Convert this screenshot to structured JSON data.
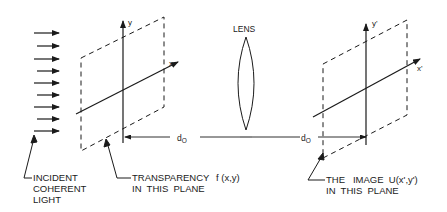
{
  "diagram": {
    "type": "optical-imaging-setup",
    "incident_light": {
      "arrow_count": 9,
      "label_lines": [
        "INCIDENT",
        "COHERENT",
        "LIGHT"
      ]
    },
    "object_plane": {
      "axis_x": "x",
      "axis_y": "y",
      "label_lines": [
        "TRANSPARENCY",
        "IN  THIS  PLANE"
      ],
      "function": "f (x,y)"
    },
    "lens": {
      "label": "LENS"
    },
    "distances": {
      "object_to_lens": "d",
      "object_to_lens_sub": "O",
      "lens_to_image": "d",
      "lens_to_image_sub": "O"
    },
    "image_plane": {
      "axis_x": "x'",
      "axis_y": "y'",
      "label_line1": "THE   IMAGE  U(x',y')",
      "label_line2": "IN  THIS  PLANE"
    },
    "colors": {
      "stroke": "#1a1a1a",
      "background": "#ffffff"
    }
  }
}
